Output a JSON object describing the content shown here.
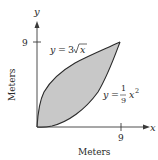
{
  "figure": {
    "axes": {
      "x_axis_label": "x",
      "y_axis_label": "y",
      "x_tick_label": "9",
      "y_tick_label": "9",
      "x_title": "Meters",
      "y_title": "Meters"
    },
    "curves": {
      "upper": {
        "lhs": "y",
        "eq": "=",
        "coef": "3",
        "rad": "x",
        "text": "y = 3√x"
      },
      "lower": {
        "lhs": "y",
        "eq": "=",
        "num": "1",
        "den": "9",
        "var": "x",
        "exp": "2",
        "text": "y = (1/9)x²"
      }
    },
    "region": {
      "fill": "#c8c8c8",
      "stroke": "#2a2a2a",
      "bounds": "0 ≤ x ≤ 9"
    }
  }
}
